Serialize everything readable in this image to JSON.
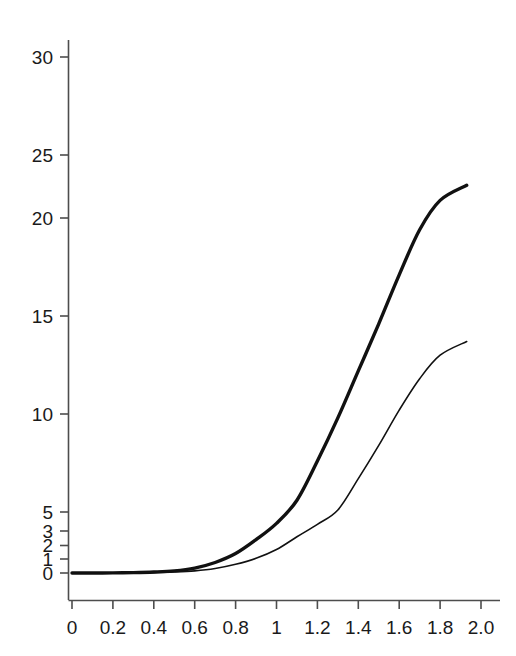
{
  "figure": {
    "background_color": "#ffffff",
    "axis_color": "#4d4d4d",
    "curve_color": "#111111"
  },
  "chart_data": {
    "type": "line",
    "title": "",
    "subtitle": "",
    "xlabel": "",
    "ylabel": "",
    "grid": false,
    "legend": "none",
    "annotations": [],
    "xlim": [
      0,
      2.0
    ],
    "ylim": [
      0,
      31
    ],
    "x_tick_labels": [
      "0",
      "0.2",
      "0.4",
      "0.6",
      "0.8",
      "1",
      "1.2",
      "1.4",
      "1.6",
      "1.8",
      "2.0"
    ],
    "x_tick_values": [
      0,
      0.2,
      0.4,
      0.6,
      0.8,
      1,
      1.2,
      1.4,
      1.6,
      1.8,
      2.0
    ],
    "y_tick_labels": [
      "0",
      "1",
      "2",
      "3",
      "5",
      "10",
      "15",
      "20",
      "25",
      "30"
    ],
    "y_tick_values": [
      0,
      1,
      2,
      3,
      5,
      10,
      15,
      20,
      25,
      30
    ],
    "y_scale": "nonlinear-compressed-near-zero",
    "x": [
      0,
      0.1,
      0.2,
      0.3,
      0.4,
      0.5,
      0.6,
      0.7,
      0.8,
      0.9,
      1.0,
      1.1,
      1.2,
      1.3,
      1.4,
      1.5,
      1.6,
      1.7,
      1.8,
      1.93
    ],
    "series": [
      {
        "name": "upper-curve",
        "style": "thick",
        "values": [
          0,
          0,
          0.01,
          0.03,
          0.07,
          0.15,
          0.35,
          0.75,
          1.4,
          2.4,
          3.8,
          5.6,
          7.6,
          9.8,
          12.2,
          14.6,
          17.1,
          19.4,
          21.4,
          22.6
        ]
      },
      {
        "name": "lower-curve",
        "style": "thin",
        "values": [
          0,
          0,
          0.0,
          0.01,
          0.03,
          0.07,
          0.15,
          0.32,
          0.62,
          1.05,
          1.7,
          2.6,
          3.7,
          5.1,
          6.7,
          8.4,
          10.2,
          11.8,
          13.0,
          13.7
        ]
      }
    ]
  }
}
